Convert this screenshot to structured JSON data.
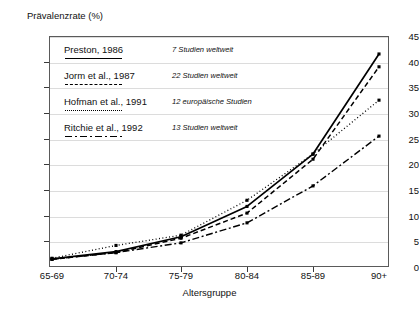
{
  "chart_data": {
    "type": "line",
    "title": "",
    "ylabel": "Prävalenzrate (%)",
    "xlabel": "Altersgruppe",
    "categories": [
      "65-69",
      "70-74",
      "75-79",
      "80-84",
      "85-89",
      "90+"
    ],
    "ylim": [
      0,
      45
    ],
    "yticks": [
      0,
      5,
      10,
      15,
      20,
      25,
      30,
      35,
      40,
      45
    ],
    "grid": true,
    "legend_position": "upper-left-inside",
    "series": [
      {
        "name": "Preston, 1986",
        "note": "7 Studien weltweit",
        "style": "solid",
        "values": [
          1.6,
          3.0,
          5.9,
          11.8,
          22.0,
          41.5
        ]
      },
      {
        "name": "Jorm et al., 1987",
        "note": "22 Studien weltweit",
        "style": "dashed",
        "values": [
          1.5,
          2.8,
          5.6,
          10.5,
          21.0,
          39.0
        ]
      },
      {
        "name": "Hofman et al., 1991",
        "note": "12 europäische Studien",
        "style": "dotted",
        "values": [
          1.7,
          4.2,
          6.2,
          13.0,
          22.0,
          32.5
        ]
      },
      {
        "name": "Ritchie et al., 1992",
        "note": "13 Studien weltweit",
        "style": "dashdot",
        "values": [
          1.5,
          2.8,
          4.7,
          8.6,
          15.8,
          25.5
        ]
      }
    ]
  },
  "axes": {
    "y_tick_labels": [
      "45",
      "40",
      "35",
      "30",
      "25",
      "20",
      "15",
      "10",
      "5",
      "0"
    ],
    "x_tick_labels": [
      "65-69",
      "70-74",
      "75-79",
      "80-84",
      "85-89",
      "90+"
    ]
  },
  "colors": {
    "line": "#000000",
    "grid": "#dcdcdc",
    "frame": "#5a5a5a",
    "text": "#111111"
  }
}
